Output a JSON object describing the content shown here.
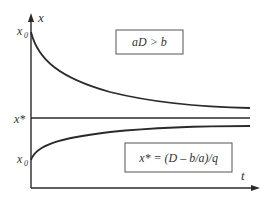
{
  "diagram": {
    "axes": {
      "y_label": "x",
      "x_label": "t"
    },
    "tick_labels": {
      "x0_top": "x",
      "x0_top_sub": "0",
      "xstar": "x*",
      "x0_bottom": "x",
      "x0_bottom_sub": "0"
    },
    "boxes": {
      "condition": "aD > b",
      "equilibrium": "x* = (D – b/a)/q"
    },
    "curves": [
      {
        "name": "decay-from-above",
        "start": "x0 (above x*)",
        "approaches": "x*"
      },
      {
        "name": "equilibrium-line",
        "value": "x*"
      },
      {
        "name": "growth-from-below",
        "start": "x0 (below x*)",
        "approaches": "x*"
      }
    ],
    "colors": {
      "line": "#2a2a2a",
      "text": "#333333",
      "background": "#ffffff"
    }
  }
}
